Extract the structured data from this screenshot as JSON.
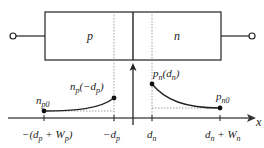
{
  "diagram": {
    "regions": {
      "p_label": "p",
      "n_label": "n"
    },
    "axis_label": "x",
    "points": {
      "n_p0": "n",
      "n_p0_sub": "p0",
      "np_edge_main": "n",
      "np_edge_sub": "p",
      "np_edge_arg": "(−d",
      "np_edge_arg_sub": "p",
      "np_edge_close": ")",
      "pn_edge_main": "p",
      "pn_edge_sub": "n",
      "pn_edge_arg": "(d",
      "pn_edge_arg_sub": "n",
      "pn_edge_close": ")",
      "p_n0": "p",
      "p_n0_sub": "n0"
    },
    "ticks": {
      "t1_a": "−(d",
      "t1_sub1": "p",
      "t1_b": " + W",
      "t1_sub2": "p",
      "t1_c": ")",
      "t2_a": "−d",
      "t2_sub": "p",
      "t3_a": "d",
      "t3_sub": "n",
      "t4_a": "d",
      "t4_sub1": "n",
      "t4_b": " + W",
      "t4_sub2": "n"
    },
    "colors": {
      "line": "#222222",
      "dotted": "#888888"
    }
  }
}
